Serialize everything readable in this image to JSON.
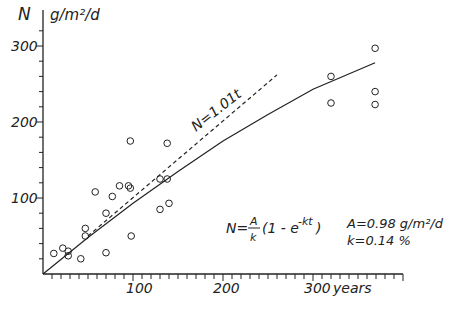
{
  "chart_data": {
    "type": "scatter",
    "title": "",
    "ylabel": "N",
    "yunit": "g/m²/d",
    "xlabel": "years",
    "xlim": [
      0,
      400
    ],
    "ylim": [
      0,
      330
    ],
    "x_ticks": [
      100,
      200,
      300
    ],
    "y_ticks": [
      100,
      200,
      300
    ],
    "grid": false,
    "series": [
      {
        "name": "observations",
        "type": "scatter",
        "points": [
          [
            12,
            27
          ],
          [
            22,
            34
          ],
          [
            28,
            30
          ],
          [
            28,
            24
          ],
          [
            42,
            20
          ],
          [
            47,
            50
          ],
          [
            47,
            60
          ],
          [
            58,
            108
          ],
          [
            70,
            80
          ],
          [
            70,
            28
          ],
          [
            77,
            102
          ],
          [
            85,
            116
          ],
          [
            95,
            116
          ],
          [
            97,
            113
          ],
          [
            97,
            175
          ],
          [
            98,
            50
          ],
          [
            130,
            125
          ],
          [
            130,
            85
          ],
          [
            138,
            125
          ],
          [
            138,
            172
          ],
          [
            140,
            93
          ],
          [
            320,
            260
          ],
          [
            320,
            225
          ],
          [
            369,
            297
          ],
          [
            369,
            240
          ],
          [
            369,
            223
          ]
        ]
      },
      {
        "name": "N = A/k (1 - e^-kt)",
        "type": "line",
        "style": "solid",
        "points": [
          [
            0,
            0
          ],
          [
            50,
            48
          ],
          [
            100,
            93
          ],
          [
            150,
            135
          ],
          [
            200,
            175
          ],
          [
            250,
            210
          ],
          [
            300,
            243
          ],
          [
            369,
            278
          ]
        ]
      },
      {
        "name": "N = 1.01 t",
        "type": "line",
        "style": "dashed",
        "points": [
          [
            50,
            50
          ],
          [
            260,
            262
          ]
        ]
      }
    ],
    "annotations": {
      "linear_label": "N=1.01t",
      "model_lhs": "N=",
      "model_frac_num": "A",
      "model_frac_den": "k",
      "model_rhs": "(1 - e",
      "model_exp": "-kt",
      "model_close": ")",
      "param_A": "A=0.98 g/m²/d",
      "param_k": "k=0.14 %"
    }
  },
  "axis": {
    "y_label": "N",
    "y_unit": "g/m²/d",
    "x_unit": "years",
    "x_tick_labels": [
      "100",
      "200",
      "300"
    ],
    "y_tick_labels": [
      "100",
      "200",
      "300"
    ]
  }
}
